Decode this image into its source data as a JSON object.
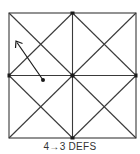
{
  "figure": {
    "caption": "4→3 DEFS",
    "colors": {
      "line": "#3a3a3a",
      "background": "#ffffff",
      "text": "#333333"
    },
    "square": {
      "x1": 9,
      "y1": 13,
      "x2": 136,
      "y2": 138
    },
    "center": {
      "x": 72.5,
      "y": 75.5
    },
    "nodes": [
      {
        "name": "top-mid",
        "x": 72.5,
        "y": 13
      },
      {
        "name": "bottom-mid",
        "x": 72.5,
        "y": 138
      },
      {
        "name": "left-mid",
        "x": 9,
        "y": 75.5
      },
      {
        "name": "right-mid",
        "x": 136,
        "y": 75.5
      },
      {
        "name": "center",
        "x": 72.5,
        "y": 75.5
      }
    ],
    "arrow": {
      "from": {
        "x": 43,
        "y": 80
      },
      "to": {
        "x": 16,
        "y": 41
      }
    }
  }
}
